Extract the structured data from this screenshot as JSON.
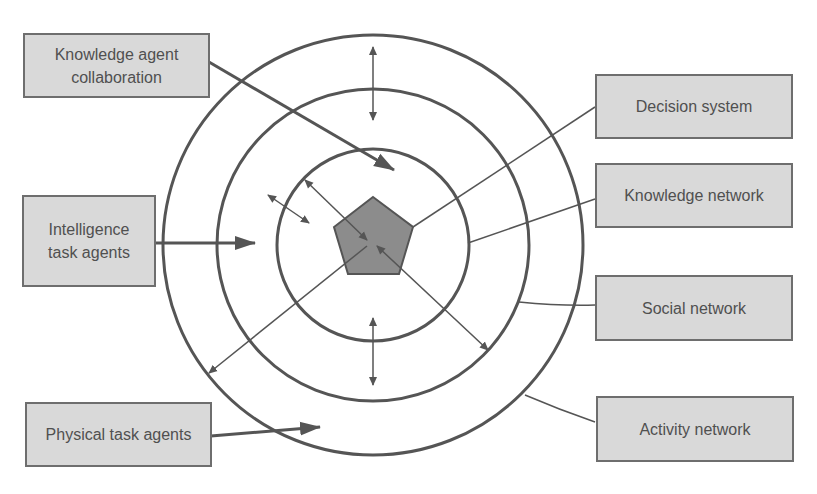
{
  "diagram": {
    "title": "",
    "center": {
      "label": "",
      "shape": "pentagon",
      "fill": "#8c8c8c"
    },
    "rings": [
      {
        "name": "decision-system",
        "radius": 95
      },
      {
        "name": "knowledge-network",
        "radius": 155
      },
      {
        "name": "social-network",
        "radius": 210
      }
    ],
    "left_labels": {
      "knowledge_agent_collaboration": "Knowledge agent collaboration",
      "knowledge_agent_collaboration_line1": "Knowledge agent",
      "knowledge_agent_collaboration_line2": "collaboration",
      "intelligence_task_agents_line1": "Intelligence",
      "intelligence_task_agents_line2": "task agents",
      "physical_task_agents": "Physical task agents"
    },
    "right_labels": {
      "decision_system": "Decision system",
      "knowledge_network": "Knowledge network",
      "social_network": "Social network",
      "activity_network": "Activity network"
    },
    "colors": {
      "line": "#555555",
      "box_fill": "#d9d9d9",
      "box_border": "#6e6e6e",
      "text": "#505050",
      "pentagon": "#8c8c8c"
    }
  }
}
